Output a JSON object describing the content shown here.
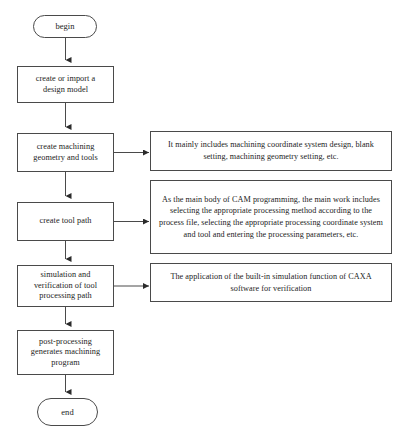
{
  "diagram": {
    "background_color": "#ffffff",
    "line_color": "#4a4a4a",
    "text_color": "#1c1c1c"
  },
  "flow": {
    "start": {
      "label": "begin"
    },
    "end": {
      "label": "end"
    },
    "steps": [
      {
        "id": "design-model",
        "label": "create or import a\ndesign model"
      },
      {
        "id": "machining-geometry",
        "label": "create machining\ngeometry and tools"
      },
      {
        "id": "tool-path",
        "label": "create tool path"
      },
      {
        "id": "simulation",
        "label": "simulation and\nverification of tool\nprocessing path"
      },
      {
        "id": "post-processing",
        "label": "post-processing\ngenerates machining\nprogram"
      }
    ]
  },
  "notes": [
    {
      "id": "note-machining-geometry",
      "for_step": "machining-geometry",
      "text": "It mainly includes machining coordinate system design, blank setting, machining geometry setting, etc."
    },
    {
      "id": "note-tool-path",
      "for_step": "tool-path",
      "text": "As the main body of CAM programming, the main work includes selecting the appropriate processing method according to the process file, selecting the appropriate processing coordinate system and tool and entering the processing parameters, etc."
    },
    {
      "id": "note-simulation",
      "for_step": "simulation",
      "text": "The application of the built-in simulation function of CAXA software for verification"
    }
  ]
}
